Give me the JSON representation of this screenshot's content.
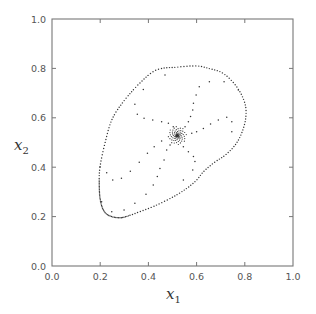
{
  "chart_data": {
    "type": "scatter",
    "title": "",
    "xlabel": "x",
    "xlabel_sub": "1",
    "ylabel": "x",
    "ylabel_sub": "2",
    "xlim": [
      0.0,
      1.0
    ],
    "ylim": [
      0.0,
      1.0
    ],
    "xticks": [
      "0.0",
      "0.2",
      "0.4",
      "0.6",
      "0.8",
      "1.0"
    ],
    "yticks": [
      "0.0",
      "0.2",
      "0.4",
      "0.6",
      "0.8",
      "1.0"
    ],
    "grid": false,
    "legend": null,
    "colors": {
      "axis": "#777777",
      "points": "#333333",
      "tick_label": "#555555"
    },
    "series": [
      {
        "name": "closed orbit (dense dotted loop)",
        "style": "dotted-closed-curve",
        "points": [
          [
            0.199,
            0.4
          ],
          [
            0.196,
            0.33
          ],
          [
            0.2,
            0.27
          ],
          [
            0.213,
            0.227
          ],
          [
            0.235,
            0.205
          ],
          [
            0.268,
            0.196
          ],
          [
            0.3,
            0.198
          ],
          [
            0.365,
            0.22
          ],
          [
            0.43,
            0.245
          ],
          [
            0.503,
            0.28
          ],
          [
            0.56,
            0.315
          ],
          [
            0.6,
            0.348
          ],
          [
            0.627,
            0.38
          ],
          [
            0.669,
            0.416
          ],
          [
            0.72,
            0.45
          ],
          [
            0.76,
            0.49
          ],
          [
            0.787,
            0.538
          ],
          [
            0.804,
            0.6
          ],
          [
            0.8,
            0.66
          ],
          [
            0.766,
            0.726
          ],
          [
            0.71,
            0.78
          ],
          [
            0.65,
            0.8
          ],
          [
            0.6,
            0.81
          ],
          [
            0.52,
            0.805
          ],
          [
            0.434,
            0.794
          ],
          [
            0.365,
            0.741
          ],
          [
            0.295,
            0.664
          ],
          [
            0.248,
            0.591
          ],
          [
            0.22,
            0.498
          ]
        ]
      },
      {
        "name": "interior trajectories (sparse points)",
        "style": "dots",
        "points": [
          [
            0.344,
            0.655
          ],
          [
            0.379,
            0.715
          ],
          [
            0.354,
            0.614
          ],
          [
            0.382,
            0.598
          ],
          [
            0.418,
            0.591
          ],
          [
            0.455,
            0.584
          ],
          [
            0.483,
            0.578
          ],
          [
            0.503,
            0.564
          ],
          [
            0.469,
            0.773
          ],
          [
            0.227,
            0.378
          ],
          [
            0.252,
            0.348
          ],
          [
            0.288,
            0.355
          ],
          [
            0.325,
            0.384
          ],
          [
            0.362,
            0.42
          ],
          [
            0.396,
            0.456
          ],
          [
            0.424,
            0.483
          ],
          [
            0.455,
            0.506
          ],
          [
            0.49,
            0.49
          ],
          [
            0.476,
            0.47
          ],
          [
            0.465,
            0.429
          ],
          [
            0.448,
            0.395
          ],
          [
            0.437,
            0.362
          ],
          [
            0.42,
            0.328
          ],
          [
            0.39,
            0.29
          ],
          [
            0.344,
            0.254
          ],
          [
            0.299,
            0.227
          ],
          [
            0.248,
            0.22
          ],
          [
            0.206,
            0.26
          ],
          [
            0.587,
            0.659
          ],
          [
            0.584,
            0.632
          ],
          [
            0.575,
            0.605
          ],
          [
            0.566,
            0.584
          ],
          [
            0.552,
            0.564
          ],
          [
            0.611,
            0.726
          ],
          [
            0.598,
            0.692
          ],
          [
            0.653,
            0.746
          ],
          [
            0.714,
            0.746
          ],
          [
            0.773,
            0.713
          ],
          [
            0.725,
            0.602
          ],
          [
            0.69,
            0.591
          ],
          [
            0.658,
            0.575
          ],
          [
            0.628,
            0.557
          ],
          [
            0.6,
            0.544
          ],
          [
            0.58,
            0.537
          ],
          [
            0.746,
            0.584
          ],
          [
            0.746,
            0.544
          ],
          [
            0.545,
            0.483
          ],
          [
            0.566,
            0.463
          ],
          [
            0.587,
            0.443
          ],
          [
            0.593,
            0.423
          ],
          [
            0.584,
            0.389
          ],
          [
            0.545,
            0.348
          ]
        ]
      },
      {
        "name": "fixed point (spiral sink)",
        "style": "star-cluster",
        "points": [
          [
            0.52,
            0.528
          ]
        ]
      }
    ]
  }
}
